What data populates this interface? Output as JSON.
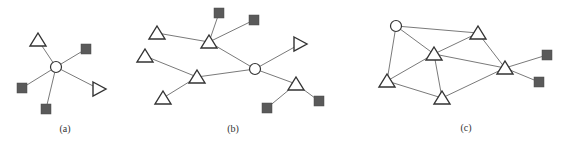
{
  "figure": {
    "panels": [
      {
        "id": "a",
        "caption": "(a)",
        "caption_pos": [
          65,
          132
        ],
        "nodes": [
          {
            "id": "a1",
            "shape": "triangle-up",
            "x": 38,
            "y": 40
          },
          {
            "id": "a2",
            "shape": "square",
            "x": 86,
            "y": 49
          },
          {
            "id": "a3",
            "shape": "circle",
            "x": 56,
            "y": 67
          },
          {
            "id": "a4",
            "shape": "square",
            "x": 22,
            "y": 88
          },
          {
            "id": "a5",
            "shape": "triangle-right",
            "x": 99,
            "y": 89
          },
          {
            "id": "a6",
            "shape": "square",
            "x": 46,
            "y": 109
          }
        ],
        "edges": [
          [
            "a3",
            "a1"
          ],
          [
            "a3",
            "a2"
          ],
          [
            "a3",
            "a4"
          ],
          [
            "a3",
            "a5"
          ],
          [
            "a3",
            "a6"
          ]
        ]
      },
      {
        "id": "b",
        "caption": "(b)",
        "caption_pos": [
          233,
          132
        ],
        "nodes": [
          {
            "id": "b1",
            "shape": "square",
            "x": 219,
            "y": 13
          },
          {
            "id": "b2",
            "shape": "square",
            "x": 254,
            "y": 20
          },
          {
            "id": "b3",
            "shape": "triangle-up",
            "x": 157,
            "y": 33
          },
          {
            "id": "b4",
            "shape": "triangle-up",
            "x": 209,
            "y": 42
          },
          {
            "id": "b5",
            "shape": "triangle-right",
            "x": 300,
            "y": 44
          },
          {
            "id": "b6",
            "shape": "triangle-up",
            "x": 145,
            "y": 56
          },
          {
            "id": "b7",
            "shape": "circle",
            "x": 255,
            "y": 69
          },
          {
            "id": "b8",
            "shape": "triangle-up",
            "x": 197,
            "y": 77
          },
          {
            "id": "b9",
            "shape": "triangle-up",
            "x": 296,
            "y": 84
          },
          {
            "id": "b10",
            "shape": "triangle-up",
            "x": 163,
            "y": 98
          },
          {
            "id": "b11",
            "shape": "square",
            "x": 319,
            "y": 101
          },
          {
            "id": "b12",
            "shape": "square",
            "x": 267,
            "y": 108
          }
        ],
        "edges": [
          [
            "b4",
            "b1"
          ],
          [
            "b4",
            "b2"
          ],
          [
            "b4",
            "b3"
          ],
          [
            "b4",
            "b7"
          ],
          [
            "b7",
            "b5"
          ],
          [
            "b7",
            "b8"
          ],
          [
            "b7",
            "b9"
          ],
          [
            "b8",
            "b6"
          ],
          [
            "b8",
            "b10"
          ],
          [
            "b9",
            "b11"
          ],
          [
            "b9",
            "b12"
          ]
        ]
      },
      {
        "id": "c",
        "caption": "(c)",
        "caption_pos": [
          466,
          131
        ],
        "nodes": [
          {
            "id": "c1",
            "shape": "circle",
            "x": 396,
            "y": 26
          },
          {
            "id": "c2",
            "shape": "triangle-up",
            "x": 478,
            "y": 33
          },
          {
            "id": "c3",
            "shape": "triangle-up",
            "x": 434,
            "y": 54
          },
          {
            "id": "c4",
            "shape": "square",
            "x": 547,
            "y": 55
          },
          {
            "id": "c5",
            "shape": "triangle-up",
            "x": 505,
            "y": 68
          },
          {
            "id": "c6",
            "shape": "triangle-up",
            "x": 387,
            "y": 81
          },
          {
            "id": "c7",
            "shape": "square",
            "x": 539,
            "y": 82
          },
          {
            "id": "c8",
            "shape": "triangle-up",
            "x": 442,
            "y": 98
          }
        ],
        "edges": [
          [
            "c1",
            "c2"
          ],
          [
            "c1",
            "c3"
          ],
          [
            "c1",
            "c6"
          ],
          [
            "c2",
            "c3"
          ],
          [
            "c2",
            "c5"
          ],
          [
            "c3",
            "c5"
          ],
          [
            "c3",
            "c6"
          ],
          [
            "c3",
            "c8"
          ],
          [
            "c6",
            "c8"
          ],
          [
            "c8",
            "c5"
          ],
          [
            "c5",
            "c4"
          ],
          [
            "c5",
            "c7"
          ]
        ]
      }
    ]
  }
}
